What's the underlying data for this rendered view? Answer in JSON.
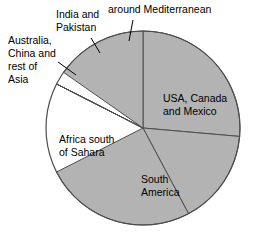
{
  "chart_data": {
    "type": "pie",
    "title": "",
    "subtitle": "",
    "xlabel": "",
    "ylabel": "",
    "grid": false,
    "legend_position": "none",
    "start_angle_deg": 0,
    "direction": "clockwise",
    "center": {
      "x": 143,
      "y": 128
    },
    "radius": 97,
    "fill_color": "#b3b3b3",
    "edge_color": "#4d4d4d",
    "background_color": "#ffffff",
    "categories": [
      "USA, Canada and Mexico",
      "South America",
      "Africa south of Sahara",
      "Australia, China and rest of Asia",
      "India and Pakistan",
      "around Mediterranean"
    ],
    "values": [
      26.4,
      15.8,
      25.3,
      12.2,
      5.0,
      15.3
    ],
    "slices": [
      {
        "label": "USA, Canada and Mexico",
        "value": 26.4,
        "start_deg": 0,
        "end_deg": 95,
        "fill": "#b3b3b3",
        "label_placement": "inside"
      },
      {
        "label": "South America",
        "value": 15.8,
        "start_deg": 95,
        "end_deg": 152,
        "fill": "#b3b3b3",
        "label_placement": "inside"
      },
      {
        "label": "Africa south of Sahara",
        "value": 25.3,
        "start_deg": 152,
        "end_deg": 243,
        "fill": "#b3b3b3",
        "label_placement": "inside"
      },
      {
        "label": "Australia, China and rest of Asia",
        "value": 12.2,
        "start_deg": 243,
        "end_deg": 287,
        "fill": "#b3b3b3",
        "label_placement": "outside-leader"
      },
      {
        "label": "India and Pakistan",
        "value": 5.0,
        "start_deg": 287,
        "end_deg": 305,
        "fill": "#b3b3b3",
        "label_placement": "outside-leader"
      },
      {
        "label": "around Mediterranean",
        "value": 15.3,
        "start_deg": 305,
        "end_deg": 360,
        "fill": "#b3b3b3",
        "label_placement": "outside-leader"
      }
    ]
  },
  "labels": {
    "usa_line1": "USA, Canada",
    "usa_line2": "and Mexico",
    "south_america_line1": "South",
    "south_america_line2": "America",
    "africa_line1": "Africa south",
    "africa_line2": "of Sahara",
    "australia_line1": "Australia,",
    "australia_line2": "China and",
    "australia_line3": "rest of",
    "australia_line4": "Asia",
    "india_line1": "India and",
    "india_line2": "Pakistan",
    "mediterranean_line1": "around Mediterranean"
  }
}
